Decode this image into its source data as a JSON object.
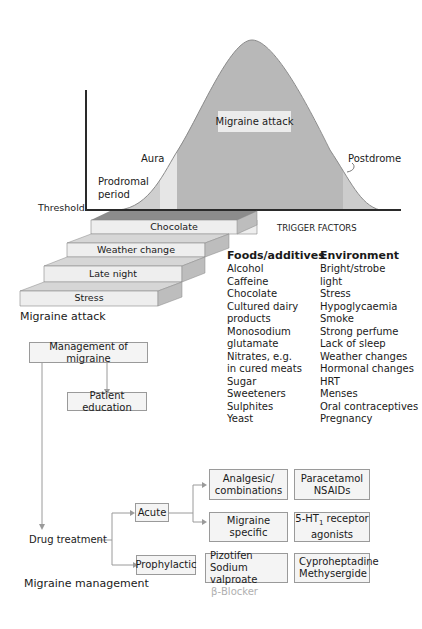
{
  "curve": {
    "peak_label": "Migraine attack",
    "aura_label": "Aura",
    "prodromal_label_line1": "Prodromal",
    "prodromal_label_line2": "period",
    "postdrome_label": "Postdrome",
    "threshold_label": "Threshold",
    "colors": {
      "attack": "#b8b8b8",
      "aura": "#e6e6e6",
      "prodromal": "#cfcfcf",
      "postdrome": "#cccccc",
      "axis": "#2a2a2a"
    }
  },
  "staircase": {
    "steps": [
      "Chocolate",
      "Weather change",
      "Late night",
      "Stress"
    ],
    "caption": "Migraine attack",
    "colors": {
      "front": "#eeeeee",
      "top": "#d6d6d6",
      "side": "#bdbdbd",
      "top_step_top": "#8c8c8c"
    }
  },
  "trigger_factors": {
    "title": "TRIGGER FACTORS",
    "foods": {
      "heading": "Foods/additives",
      "items": [
        "Alcohol",
        "Caffeine",
        "Chocolate",
        "Cultured dairy",
        "products",
        "Monosodium",
        "glutamate",
        "Nitrates, e.g.",
        "in cured meats",
        "Sugar",
        "Sweeteners",
        "Sulphites",
        "Yeast"
      ]
    },
    "environment": {
      "heading": "Environment",
      "items": [
        "Bright/strobe",
        "light",
        "Stress",
        "Hypoglycaemia",
        "Smoke",
        "Strong perfume",
        "Lack of sleep",
        "Weather changes",
        "Hormonal changes",
        "HRT",
        "Menses",
        "Oral contraceptives",
        "Pregnancy"
      ]
    }
  },
  "management": {
    "root": "Management of migraine",
    "education": "Patient education",
    "drug_treatment": "Drug treatment",
    "acute": "Acute",
    "prophylactic": "Prophylactic",
    "analgesic_line1": "Analgesic/",
    "analgesic_line2": "combinations",
    "analgesic_drugs_line1": "Paracetamol",
    "analgesic_drugs_line2": "NSAIDs",
    "specific_line1": "Migraine",
    "specific_line2": "specific",
    "specific_drugs_pre": "5-HT",
    "specific_drugs_sub": "1",
    "specific_drugs_post": " receptor",
    "specific_drugs_line2": "agonists",
    "prophylactic_drugs1_line1": "Pizotifen",
    "prophylactic_drugs1_line2": "Sodium valproate",
    "prophylactic_drugs2_line1": "Cyproheptadine",
    "prophylactic_drugs2_line2": "Methysergide",
    "beta_blocker": "β-Blocker",
    "caption": "Migraine management"
  }
}
